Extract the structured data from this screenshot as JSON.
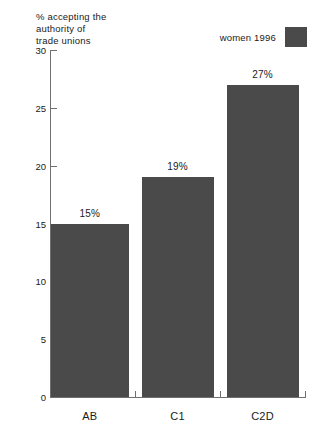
{
  "chart_data": {
    "type": "bar",
    "title": "% accepting the\nauthority of\ntrade unions",
    "title_lines": [
      "% accepting the",
      "authority of",
      "trade unions"
    ],
    "xlabel": "",
    "ylabel": "",
    "categories": [
      "AB",
      "C1",
      "C2D"
    ],
    "values": [
      15,
      19,
      27
    ],
    "value_labels": [
      "15%",
      "19%",
      "27%"
    ],
    "ylim": [
      0,
      30
    ],
    "ytick_labels": [
      "0",
      "5",
      "10",
      "15",
      "20",
      "25",
      "30"
    ],
    "ytick_values": [
      0,
      5,
      10,
      15,
      20,
      25,
      30
    ],
    "grid": false,
    "legend_position": "top-right",
    "series": [
      {
        "name": "women 1996",
        "values": [
          15,
          19,
          27
        ],
        "color": "#4a4a4a"
      }
    ]
  },
  "legend": {
    "label": "women 1996",
    "swatch_color": "#4a4a4a"
  },
  "axis": {
    "line_color": "#6f6f6f"
  }
}
